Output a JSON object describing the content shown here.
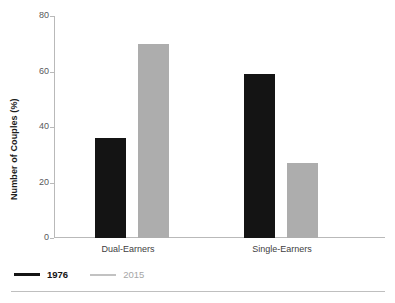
{
  "chart_data": {
    "type": "bar",
    "title": "",
    "subtitle": "",
    "xlabel": "",
    "ylabel": "Number of Couples (%)",
    "categories": [
      "Dual-Earners",
      "Single-Earners"
    ],
    "series": [
      {
        "name": "1976",
        "color": "#141414",
        "values": [
          36,
          59
        ]
      },
      {
        "name": "2015",
        "color": "#adadad",
        "values": [
          70,
          27
        ]
      }
    ],
    "ylim": [
      0,
      80
    ],
    "yticks": [
      0,
      20,
      40,
      60,
      80
    ],
    "ytick_labels": [
      "0",
      "20",
      "40",
      "60",
      "80"
    ],
    "grid": false,
    "legend_position": "bottom-left"
  },
  "axes": {
    "y_title": "Number of Couples (%)",
    "y_tick_labels": [
      "80",
      "60",
      "40",
      "20",
      "0"
    ],
    "x_tick_labels": [
      "Dual-Earners",
      "Single-Earners"
    ]
  },
  "legend": {
    "items": [
      {
        "label": "1976",
        "color": "#141414"
      },
      {
        "label": "2015",
        "color": "#adadad"
      }
    ]
  },
  "colors": {
    "series_1976": "#141414",
    "series_2015": "#adadad",
    "axis": "#b9b9b9",
    "text": "#414042",
    "rule": "#bfbfbf"
  }
}
